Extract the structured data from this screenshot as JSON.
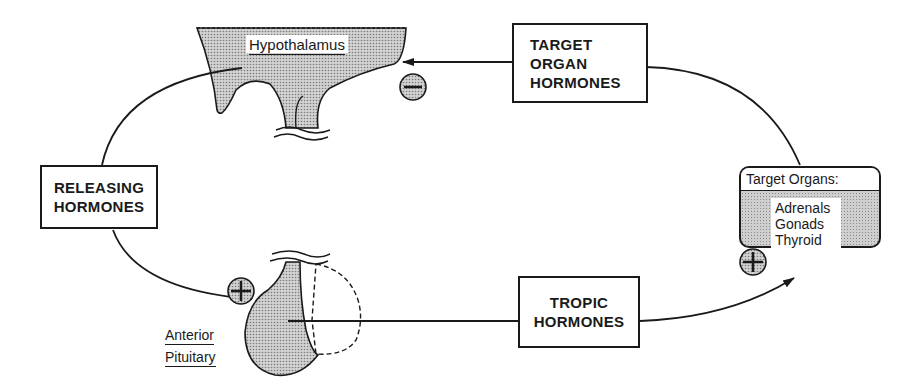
{
  "diagram": {
    "nodes": {
      "hypothalamus": {
        "label": "Hypothalamus"
      },
      "releasing_hormones": {
        "lines": [
          "RELEASING",
          "HORMONES"
        ]
      },
      "anterior_pituitary": {
        "lines": [
          "Anterior",
          "Pituitary"
        ]
      },
      "tropic_hormones": {
        "lines": [
          "TROPIC",
          "HORMONES"
        ]
      },
      "target_organs": {
        "title": "Target Organs:",
        "items": [
          "Adrenals",
          "Gonads",
          "Thyroid"
        ]
      },
      "target_organ_hormones": {
        "lines": [
          "TARGET",
          "ORGAN",
          "HORMONES"
        ]
      }
    },
    "signs": {
      "negative_feedback": "−",
      "pituitary_stimulation": "+",
      "target_stimulation": "+"
    },
    "edges": [
      {
        "from": "hypothalamus",
        "to": "releasing_hormones"
      },
      {
        "from": "releasing_hormones",
        "to": "anterior_pituitary",
        "sign": "+"
      },
      {
        "from": "anterior_pituitary",
        "to": "tropic_hormones"
      },
      {
        "from": "tropic_hormones",
        "to": "target_organs",
        "sign": "+"
      },
      {
        "from": "target_organs",
        "to": "target_organ_hormones"
      },
      {
        "from": "target_organ_hormones",
        "to": "hypothalamus",
        "sign": "−"
      }
    ]
  }
}
